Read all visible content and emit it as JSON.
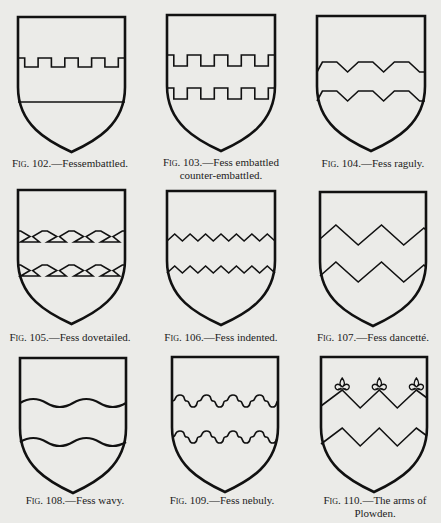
{
  "page": {
    "background": "#ebebe8",
    "ink": "#111111"
  },
  "figures": [
    {
      "id": "fig-102",
      "number": "Fig. 102.",
      "title": "—Fessembattled.",
      "title_line2": "",
      "type": "embattled",
      "x": 18,
      "y": 17,
      "w": 107,
      "h": 135,
      "cap_x": 70,
      "cap_y": 157
    },
    {
      "id": "fig-103",
      "number": "Fig. 103.",
      "title": "—Fess embattled",
      "title_line2": "counter-embattled.",
      "type": "embattled-counter",
      "x": 167,
      "y": 15,
      "w": 108,
      "h": 136,
      "cap_x": 221,
      "cap_y": 156
    },
    {
      "id": "fig-104",
      "number": "Fig. 104.",
      "title": "—Fess raguly.",
      "title_line2": "",
      "type": "raguly",
      "x": 317,
      "y": 16,
      "w": 108,
      "h": 135,
      "cap_x": 373,
      "cap_y": 157
    },
    {
      "id": "fig-105",
      "number": "Fig. 105.",
      "title": "—Fess dovetailed.",
      "title_line2": "",
      "type": "dovetailed",
      "x": 18,
      "y": 190,
      "w": 107,
      "h": 134,
      "cap_x": 70,
      "cap_y": 331
    },
    {
      "id": "fig-106",
      "number": "Fig. 106.",
      "title": "—Fess indented.",
      "title_line2": "",
      "type": "indented",
      "x": 167,
      "y": 191,
      "w": 108,
      "h": 134,
      "cap_x": 221,
      "cap_y": 331
    },
    {
      "id": "fig-107",
      "number": "Fig. 107.",
      "title": "—Fess dancetté.",
      "title_line2": "",
      "type": "dancette",
      "x": 320,
      "y": 192,
      "w": 106,
      "h": 134,
      "cap_x": 373,
      "cap_y": 331
    },
    {
      "id": "fig-108",
      "number": "Fig. 108.",
      "title": "—Fess wavy.",
      "title_line2": "",
      "type": "wavy",
      "x": 20,
      "y": 358,
      "w": 106,
      "h": 135,
      "cap_x": 75,
      "cap_y": 494
    },
    {
      "id": "fig-109",
      "number": "Fig. 109.",
      "title": "—Fess nebuly.",
      "title_line2": "",
      "type": "nebuly",
      "x": 172,
      "y": 357,
      "w": 106,
      "h": 135,
      "cap_x": 222,
      "cap_y": 494
    },
    {
      "id": "fig-110",
      "number": "Fig. 110.",
      "title": "—The arms of",
      "title_line2": "Plowden.",
      "type": "plowden",
      "x": 321,
      "y": 357,
      "w": 106,
      "h": 135,
      "cap_x": 375,
      "cap_y": 494
    }
  ]
}
